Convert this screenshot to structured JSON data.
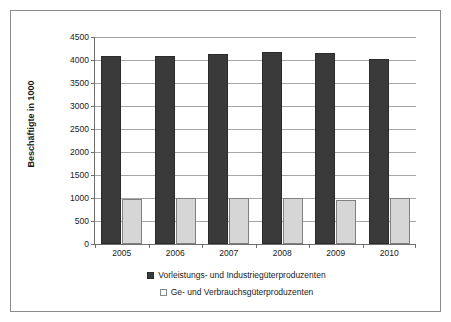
{
  "chart_data": {
    "type": "bar",
    "title": "",
    "subtitle": "",
    "xlabel": "",
    "ylabel": "Beschäftigte in 1000",
    "categories": [
      "2005",
      "2006",
      "2007",
      "2008",
      "2009",
      "2010"
    ],
    "series": [
      {
        "name": "Vorleistungs- und Industriegüterproduzenten",
        "color": "#3a3a3a",
        "values": [
          4080,
          4090,
          4140,
          4165,
          4155,
          4030
        ]
      },
      {
        "name": "Ge- und Verbrauchsgüterproduzenten",
        "color": "#d6d6d6",
        "values": [
          980,
          1010,
          1010,
          995,
          960,
          1000
        ]
      }
    ],
    "ylim": [
      0,
      4500
    ],
    "ytick_values": [
      0,
      500,
      1000,
      1500,
      2000,
      2500,
      3000,
      3500,
      4000,
      4500
    ],
    "ytick_labels": [
      "0",
      "500",
      "1000",
      "1500",
      "2000",
      "2500",
      "3000",
      "3500",
      "4000",
      "4500"
    ],
    "grid": "horizontal",
    "legend_position": "bottom"
  },
  "legend": {
    "entries": [
      {
        "label": "Vorleistungs- und Industriegüterproduzenten",
        "swatch": "dark-square-icon"
      },
      {
        "label": "Ge- und Verbrauchsgüterproduzenten",
        "swatch": "light-square-icon"
      }
    ]
  }
}
